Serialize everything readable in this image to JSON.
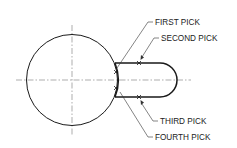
{
  "diagram": {
    "type": "technical-drawing",
    "colors": {
      "line": "#1a1a1a",
      "centerline": "#666666",
      "text": "#222222",
      "background": "#ffffff"
    },
    "labels": {
      "first_pick": "FIRST PICK",
      "second_pick": "SECOND PICK",
      "third_pick": "THIRD PICK",
      "fourth_pick": "FOURTH PICK"
    }
  }
}
